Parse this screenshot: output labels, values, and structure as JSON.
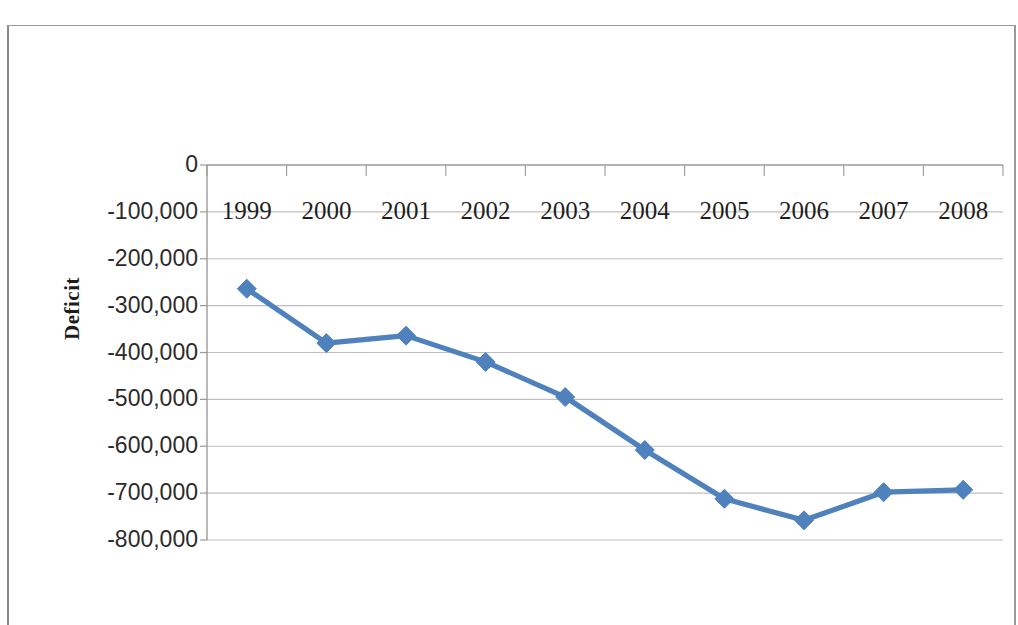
{
  "chart_data": {
    "type": "line",
    "title": "",
    "subtitle": "",
    "xlabel": "",
    "ylabel": "Deficit",
    "categories": [
      "1999",
      "2000",
      "2001",
      "2002",
      "2003",
      "2004",
      "2005",
      "2006",
      "2007",
      "2008"
    ],
    "series": [
      {
        "name": "Deficit",
        "values": [
          -264000,
          -380000,
          -364000,
          -420000,
          -495000,
          -608000,
          -712000,
          -758000,
          -698000,
          -693000
        ]
      }
    ],
    "ylim": [
      -800000,
      0
    ],
    "y_ticks": [
      0,
      -100000,
      -200000,
      -300000,
      -400000,
      -500000,
      -600000,
      -700000,
      -800000
    ],
    "y_tick_labels": [
      "0",
      "-100,000",
      "-200,000",
      "-300,000",
      "-400,000",
      "-500,000",
      "-600,000",
      "-700,000",
      "-800,000"
    ],
    "x_tick_labels": [
      "1999",
      "2000",
      "2001",
      "2002",
      "2003",
      "2004",
      "2005",
      "2006",
      "2007",
      "2008"
    ],
    "grid": true,
    "grid_axis": "y",
    "legend": false,
    "legend_position": "none",
    "marker": "diamond",
    "series_color": "#4F81BD",
    "gridline_color": "#BFBFBF",
    "axis_color": "#9A9A9A",
    "x_axis_label_position": "low",
    "annotations": []
  },
  "axis": {
    "y_title": "Deficit"
  }
}
